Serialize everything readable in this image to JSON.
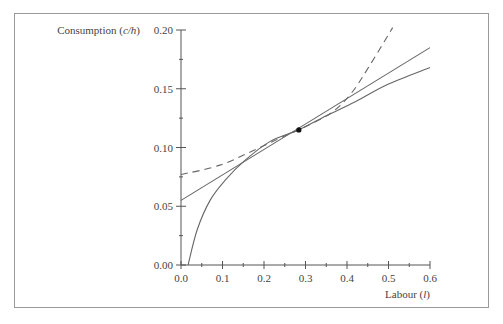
{
  "chart_data": {
    "type": "line",
    "title": "",
    "xlabel": "Labour (l)",
    "ylabel": "Consumption (c/h)",
    "xlim": [
      0.0,
      0.6
    ],
    "ylim": [
      0.0,
      0.2
    ],
    "x_ticks": [
      "0.0",
      "0.1",
      "0.2",
      "0.3",
      "0.4",
      "0.5",
      "0.6"
    ],
    "y_ticks": [
      "0.00",
      "0.05",
      "0.10",
      "0.15",
      "0.20"
    ],
    "grid": false,
    "legend": null,
    "series": [
      {
        "name": "concave curve (solid)",
        "style": "solid",
        "points": [
          [
            0.017,
            0.0
          ],
          [
            0.039,
            0.03
          ],
          [
            0.07,
            0.055
          ],
          [
            0.106,
            0.072
          ],
          [
            0.154,
            0.089
          ],
          [
            0.214,
            0.105
          ],
          [
            0.284,
            0.115
          ],
          [
            0.35,
            0.127
          ],
          [
            0.42,
            0.139
          ],
          [
            0.5,
            0.154
          ],
          [
            0.6,
            0.168
          ]
        ]
      },
      {
        "name": "tangent line (solid)",
        "style": "solid",
        "points": [
          [
            0.0,
            0.055
          ],
          [
            0.6,
            0.185
          ]
        ]
      },
      {
        "name": "convex curve (dashed)",
        "style": "dashed",
        "points": [
          [
            0.0,
            0.077
          ],
          [
            0.094,
            0.085
          ],
          [
            0.19,
            0.1
          ],
          [
            0.263,
            0.112
          ],
          [
            0.284,
            0.115
          ],
          [
            0.36,
            0.129
          ],
          [
            0.41,
            0.146
          ],
          [
            0.455,
            0.17
          ],
          [
            0.51,
            0.202
          ]
        ]
      }
    ],
    "annotations": [
      {
        "type": "point",
        "x": 0.284,
        "y": 0.115,
        "label": "tangency point"
      }
    ]
  },
  "labels": {
    "ylabel_prefix": "Consumption (",
    "ylabel_var": "c/h",
    "ylabel_suffix": ")",
    "xlabel_prefix": "Labour (",
    "xlabel_var": "l",
    "xlabel_suffix": ")"
  }
}
